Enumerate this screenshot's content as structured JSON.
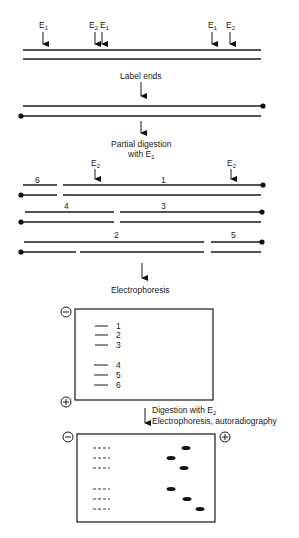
{
  "figure": {
    "top_dna": {
      "enzyme_sites": [
        {
          "label": "E",
          "sub": "1",
          "x": 43
        },
        {
          "label": "E",
          "sub": "2",
          "x": 95
        },
        {
          "label": "E",
          "sub": "1",
          "x": 102
        },
        {
          "label": "E",
          "sub": "1",
          "x": 212
        },
        {
          "label": "E",
          "sub": "2",
          "x": 230
        }
      ]
    },
    "step1_label": "Label ends",
    "step2_label_line1": "Partial digestion",
    "step2_label_line2": "with E",
    "step2_label_sub": "1",
    "partial_digest": {
      "e2_sites": [
        {
          "label": "E",
          "sub": "2",
          "x": 95
        },
        {
          "label": "E",
          "sub": "2",
          "x": 231
        }
      ],
      "fragment_labels": [
        {
          "num": "6",
          "x": 38,
          "y": 181
        },
        {
          "num": "1",
          "x": 164,
          "y": 181
        },
        {
          "num": "4",
          "x": 67,
          "y": 207
        },
        {
          "num": "3",
          "x": 164,
          "y": 207
        },
        {
          "num": "2",
          "x": 117,
          "y": 237
        },
        {
          "num": "5",
          "x": 234,
          "y": 237
        }
      ]
    },
    "step3_label": "Electrophoresis",
    "gel1": {
      "negative_symbol": "−",
      "positive_symbol": "+",
      "bands": [
        {
          "label": "1",
          "y": 326
        },
        {
          "label": "2",
          "y": 335
        },
        {
          "label": "3",
          "y": 345
        },
        {
          "label": "4",
          "y": 365
        },
        {
          "label": "5",
          "y": 375
        },
        {
          "label": "6",
          "y": 385
        }
      ]
    },
    "step4_line1": "Digestion with E",
    "step4_line1_sub": "2",
    "step4_line2": "Electrophoresis, autoradiography",
    "gel2": {
      "negative_symbol": "−",
      "positive_symbol": "+",
      "rows": [
        {
          "y": 448,
          "spot_x": 186
        },
        {
          "y": 458,
          "spot_x": 171
        },
        {
          "y": 468,
          "spot_x": 184
        },
        {
          "y": 489,
          "spot_x": 171
        },
        {
          "y": 499,
          "spot_x": 187
        },
        {
          "y": 509,
          "spot_x": 200
        }
      ]
    }
  }
}
